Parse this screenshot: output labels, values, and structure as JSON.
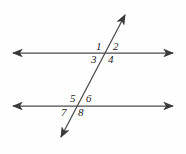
{
  "figure": {
    "background_color": "#fefefe",
    "stroke_color": "#3a3a3a",
    "label_color": "#1d1d1d"
  },
  "lines": {
    "top_parallel": {
      "name": "top parallel line",
      "x1": 9,
      "y1": 53,
      "x2": 177,
      "y2": 53,
      "arrow_start": true,
      "arrow_end": true
    },
    "bottom_parallel": {
      "name": "bottom parallel line",
      "x1": 9,
      "y1": 106,
      "x2": 177,
      "y2": 106,
      "arrow_start": true,
      "arrow_end": true
    },
    "transversal": {
      "name": "transversal line",
      "x1": 58,
      "y1": 143,
      "x2": 128,
      "y2": 10,
      "arrow_start": true,
      "arrow_end": true
    }
  },
  "intersections": [
    {
      "name": "upper-intersection",
      "x": 110,
      "y": 53
    },
    {
      "name": "lower-intersection",
      "x": 81,
      "y": 106
    }
  ],
  "angle_labels": [
    {
      "id": "1",
      "text": "1",
      "x": 97,
      "y": 42,
      "position": "upper-left"
    },
    {
      "id": "2",
      "text": "2",
      "x": 114,
      "y": 42,
      "position": "upper-right"
    },
    {
      "id": "3",
      "text": "3",
      "x": 92,
      "y": 55,
      "position": "lower-left"
    },
    {
      "id": "4",
      "text": "4",
      "x": 109,
      "y": 55,
      "position": "lower-right"
    },
    {
      "id": "5",
      "text": "5",
      "x": 70,
      "y": 94,
      "position": "upper-left"
    },
    {
      "id": "6",
      "text": "6",
      "x": 86,
      "y": 94,
      "position": "upper-right"
    },
    {
      "id": "7",
      "text": "7",
      "x": 62,
      "y": 107,
      "position": "lower-left"
    },
    {
      "id": "8",
      "text": "8",
      "x": 79,
      "y": 107,
      "position": "lower-right"
    }
  ]
}
